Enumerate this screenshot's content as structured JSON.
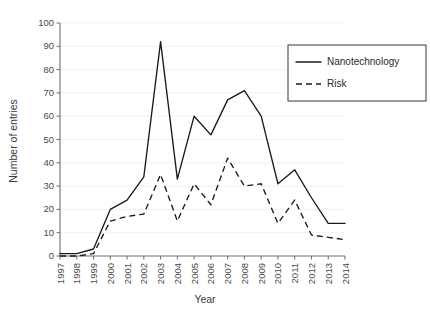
{
  "chart_data": {
    "type": "line",
    "title": "",
    "xlabel": "Year",
    "ylabel": "Number of entries",
    "categories": [
      "1997",
      "1998",
      "1999",
      "2000",
      "2001",
      "2002",
      "2003",
      "2004",
      "2005",
      "2006",
      "2007",
      "2008",
      "2009",
      "2010",
      "2011",
      "2012",
      "2013",
      "2014"
    ],
    "x": [
      1997,
      1998,
      1999,
      2000,
      2001,
      2002,
      2003,
      2004,
      2005,
      2006,
      2007,
      2008,
      2009,
      2010,
      2011,
      2012,
      2013,
      2014
    ],
    "series": [
      {
        "name": "Nanotechnology",
        "style": "solid",
        "values": [
          1,
          1,
          3,
          20,
          24,
          34,
          92,
          33,
          60,
          52,
          67,
          71,
          60,
          31,
          37,
          25,
          14,
          14
        ]
      },
      {
        "name": "Risk",
        "style": "dashed",
        "values": [
          0,
          0,
          1,
          15,
          17,
          18,
          35,
          15,
          31,
          22,
          42,
          30,
          31,
          14,
          24,
          9,
          8,
          7
        ]
      }
    ],
    "ylim": [
      0,
      100
    ],
    "yticks": [
      0,
      10,
      20,
      30,
      40,
      50,
      60,
      70,
      80,
      90,
      100
    ],
    "ytick_labels": [
      "0",
      "10",
      "20",
      "30",
      "40",
      "50",
      "60",
      "70",
      "80",
      "90",
      "100"
    ],
    "grid": "horizontal",
    "grid_color": "#ededed",
    "axis_color": "#6e6e6e",
    "line_color": "#1a1a1a",
    "background": "#ffffff",
    "legend": {
      "position": "top-right",
      "entries": [
        {
          "label": "Nanotechnology",
          "style": "solid"
        },
        {
          "label": "Risk",
          "style": "dashed"
        }
      ]
    }
  }
}
